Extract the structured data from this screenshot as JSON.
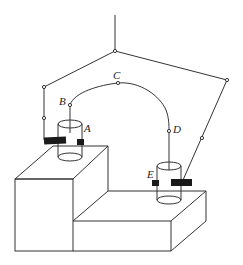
{
  "diagram": {
    "labels": {
      "A": "A",
      "B": "B",
      "C": "C",
      "D": "D",
      "E": "E"
    },
    "colors": {
      "line": "#333333",
      "clamp": "#1a1a1a",
      "background": "#ffffff"
    }
  }
}
